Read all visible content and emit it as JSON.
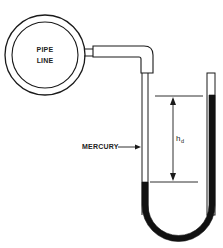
{
  "diagram": {
    "type": "u-tube-manometer",
    "labels": {
      "pipe_line_1": "PIPE",
      "pipe_line_2": "LINE",
      "mercury": "MERCURY",
      "height_main": "h",
      "height_sub": "d"
    },
    "colors": {
      "line": "#1a1a1a",
      "mercury": "#111111",
      "background": "#ffffff"
    }
  }
}
